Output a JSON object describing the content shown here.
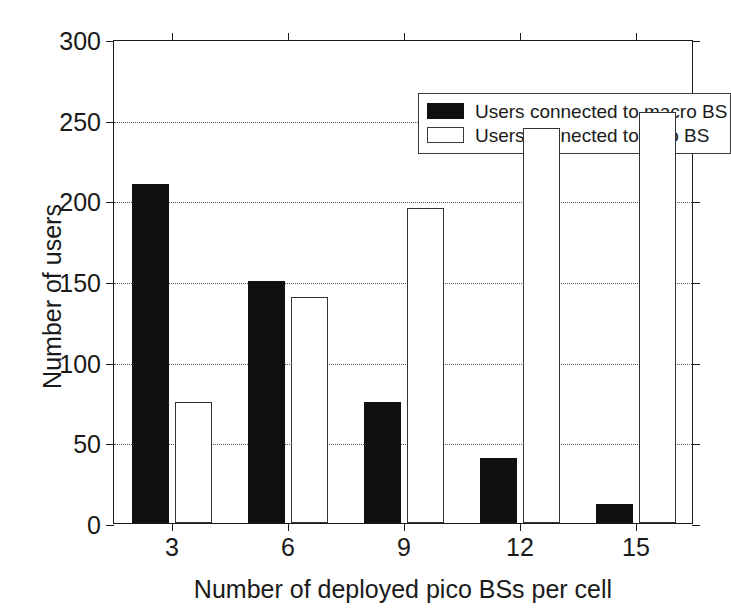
{
  "chart_data": {
    "type": "bar",
    "title": "",
    "xlabel": "Number of deployed pico BSs per cell",
    "ylabel": "Number of users",
    "categories": [
      "3",
      "6",
      "9",
      "12",
      "15"
    ],
    "series": [
      {
        "name": "Users connected to macro BS",
        "color": "#101010",
        "fill": "solid",
        "values": [
          210,
          150,
          75,
          40,
          12
        ]
      },
      {
        "name": "Users connected to pico BS",
        "color": "#ffffff",
        "fill": "hollow",
        "values": [
          75,
          140,
          195,
          245,
          255
        ]
      }
    ],
    "ylim": [
      0,
      300
    ],
    "yticks": [
      0,
      50,
      100,
      150,
      200,
      250,
      300
    ],
    "ytick_labels": [
      "0",
      "50",
      "100",
      "150",
      "200",
      "250",
      "300"
    ],
    "xtick_labels": [
      "3",
      "6",
      "9",
      "12",
      "15"
    ],
    "grid": "horizontal-dotted",
    "legend_position": "top-right"
  },
  "legend": {
    "entries": [
      {
        "label": "Users connected to macro BS",
        "swatch": "macro"
      },
      {
        "label": "Users connected to pico BS",
        "swatch": "pico"
      }
    ]
  }
}
